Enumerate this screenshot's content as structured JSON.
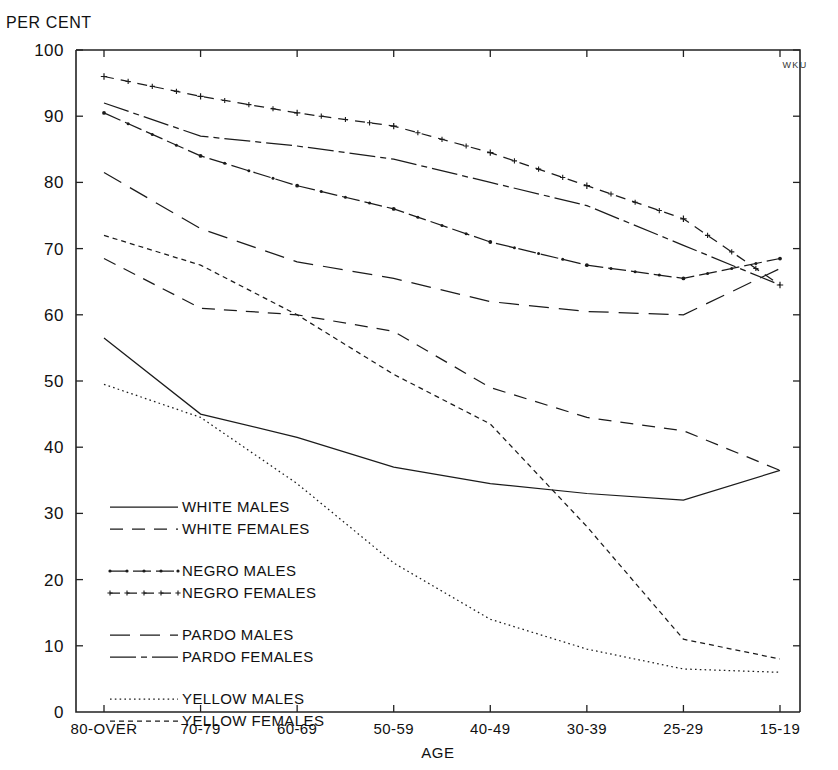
{
  "chart_data": {
    "type": "line",
    "title": "",
    "unit_label": "PER CENT",
    "xlabel": "AGE",
    "ylabel": "",
    "corner_mark": "WKU",
    "ylim": [
      0,
      100
    ],
    "ytick_values": [
      0,
      10,
      20,
      30,
      40,
      50,
      60,
      70,
      80,
      90,
      100
    ],
    "ytick_labels": [
      "0",
      "10",
      "20",
      "30",
      "40",
      "50",
      "60",
      "70",
      "80",
      "90",
      "100"
    ],
    "grid": false,
    "legend_position": "inside-lower-left",
    "categories": [
      "80-OVER",
      "70-79",
      "60-69",
      "50-59",
      "40-49",
      "30-39",
      "25-29",
      "15-19"
    ],
    "series": [
      {
        "name": "WHITE MALES",
        "style": "solid",
        "values": [
          56.5,
          45.0,
          41.5,
          37.0,
          34.5,
          33.0,
          32.0,
          36.5
        ]
      },
      {
        "name": "WHITE FEMALES",
        "style": "dashed",
        "values": [
          68.5,
          61.0,
          60.0,
          57.5,
          49.0,
          44.5,
          42.5,
          36.5
        ]
      },
      {
        "name": "NEGRO MALES",
        "style": "dash-dot-marker",
        "values": [
          90.5,
          84.0,
          79.5,
          76.0,
          71.0,
          67.5,
          65.5,
          68.5
        ]
      },
      {
        "name": "NEGRO FEMALES",
        "style": "dash-plus",
        "values": [
          96.0,
          93.0,
          90.5,
          88.5,
          84.5,
          79.5,
          74.5,
          64.5
        ]
      },
      {
        "name": "PARDO MALES",
        "style": "long-dash",
        "values": [
          81.5,
          73.0,
          68.0,
          65.5,
          62.0,
          60.5,
          60.0,
          67.0
        ]
      },
      {
        "name": "PARDO FEMALES",
        "style": "dash-dot-long",
        "values": [
          92.0,
          87.0,
          85.5,
          83.5,
          80.0,
          76.5,
          70.5,
          64.5
        ]
      },
      {
        "name": "YELLOW MALES",
        "style": "dotted",
        "values": [
          49.5,
          44.5,
          34.5,
          22.5,
          14.0,
          9.5,
          6.5,
          6.0
        ]
      },
      {
        "name": "YELLOW FEMALES",
        "style": "fine-dashed",
        "values": [
          72.0,
          67.5,
          60.0,
          51.0,
          43.5,
          28.0,
          11.0,
          8.0
        ]
      }
    ]
  },
  "legend": {
    "groups": [
      {
        "entries": [
          {
            "label": "WHITE MALES",
            "style": "solid"
          },
          {
            "label": "WHITE FEMALES",
            "style": "dashed"
          }
        ]
      },
      {
        "entries": [
          {
            "label": "NEGRO MALES",
            "style": "dash-dot-marker"
          },
          {
            "label": "NEGRO FEMALES",
            "style": "dash-plus"
          }
        ]
      },
      {
        "entries": [
          {
            "label": "PARDO MALES",
            "style": "long-dash"
          },
          {
            "label": "PARDO FEMALES",
            "style": "dash-dot-long"
          }
        ]
      },
      {
        "entries": [
          {
            "label": "YELLOW MALES",
            "style": "dotted"
          },
          {
            "label": "YELLOW FEMALES",
            "style": "fine-dashed"
          }
        ]
      }
    ]
  },
  "colors": {
    "ink": "#1b1b1b",
    "background": "#ffffff"
  }
}
